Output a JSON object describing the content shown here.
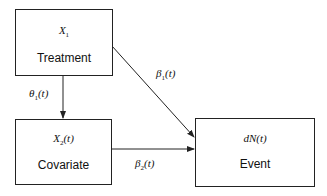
{
  "diagram": {
    "nodes": [
      {
        "id": "treatment",
        "variable": "X",
        "variable_sub": "1",
        "variable_suffix": "",
        "label": "Treatment"
      },
      {
        "id": "covariate",
        "variable": "X",
        "variable_sub": "2",
        "variable_suffix": "(t)",
        "label": "Covariate"
      },
      {
        "id": "event",
        "variable": "dN(t)",
        "variable_sub": "",
        "variable_suffix": "",
        "label": "Event"
      }
    ],
    "edges": [
      {
        "from": "treatment",
        "to": "covariate",
        "coef": "θ",
        "coef_sub": "1",
        "coef_suffix": "(t)"
      },
      {
        "from": "treatment",
        "to": "event",
        "coef": "β",
        "coef_sub": "1",
        "coef_suffix": "(t)"
      },
      {
        "from": "covariate",
        "to": "event",
        "coef": "β",
        "coef_sub": "2",
        "coef_suffix": "(t)"
      }
    ]
  }
}
